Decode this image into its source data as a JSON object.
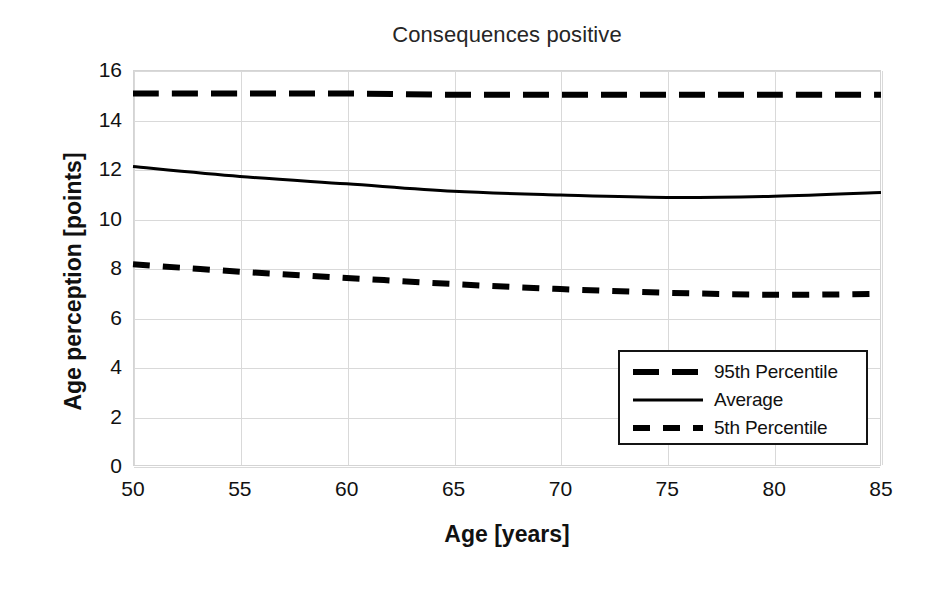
{
  "chart_data": {
    "type": "line",
    "title": "Consequences positive",
    "xlabel": "Age [years]",
    "ylabel": "Age perception [points]",
    "xlim": [
      50,
      85
    ],
    "ylim": [
      0,
      16
    ],
    "xticks": [
      50,
      55,
      60,
      65,
      70,
      75,
      80,
      85
    ],
    "yticks": [
      0,
      2,
      4,
      6,
      8,
      10,
      12,
      14,
      16
    ],
    "grid": "horizontal-and-vertical",
    "legend_position": "lower-right-inside",
    "x": [
      50,
      55,
      60,
      65,
      70,
      75,
      80,
      85
    ],
    "series": [
      {
        "name": "95th Percentile",
        "style": "dashed-long",
        "color": "#000000",
        "values": [
          15.05,
          15.05,
          15.05,
          15.0,
          15.0,
          15.0,
          15.0,
          15.0
        ]
      },
      {
        "name": "Average",
        "style": "solid",
        "color": "#000000",
        "values": [
          12.1,
          11.7,
          11.4,
          11.1,
          10.95,
          10.85,
          10.9,
          11.05
        ]
      },
      {
        "name": "5th Percentile",
        "style": "dashed-short",
        "color": "#000000",
        "values": [
          8.15,
          7.85,
          7.6,
          7.35,
          7.15,
          7.0,
          6.92,
          6.95
        ]
      }
    ]
  },
  "legend": {
    "items": [
      {
        "label": "95th Percentile",
        "style": "dashed-long"
      },
      {
        "label": "Average",
        "style": "solid"
      },
      {
        "label": "5th Percentile",
        "style": "dashed-short"
      }
    ]
  },
  "colors": {
    "line": "#000000",
    "grid": "#d9d9d9",
    "frame": "#d4d4d4",
    "text": "#111111",
    "title": "#262626",
    "legend_border": "#141414",
    "background": "#ffffff"
  }
}
